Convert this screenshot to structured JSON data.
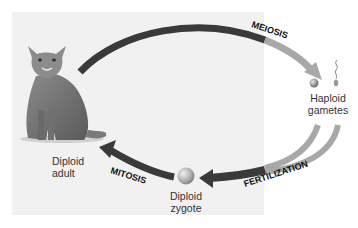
{
  "colors": {
    "panel_bg": "#f1f1f1",
    "arrow_dark": "#3a3a3a",
    "arrow_light": "#a8a8a8",
    "label_text": "#333333",
    "process_text": "#111111"
  },
  "nodes": {
    "adult": {
      "line1": "Diploid",
      "line2": "adult",
      "icon": "cat-icon"
    },
    "gametes": {
      "line1": "Haploid",
      "line2": "gametes",
      "icon": "egg-and-sperm-icon"
    },
    "zygote": {
      "line1": "Diploid",
      "line2": "zygote",
      "icon": "zygote-cell-icon"
    }
  },
  "processes": {
    "meiosis": "MEIOSIS",
    "fertilization": "FERTILIZATION",
    "mitosis": "MITOSIS"
  }
}
